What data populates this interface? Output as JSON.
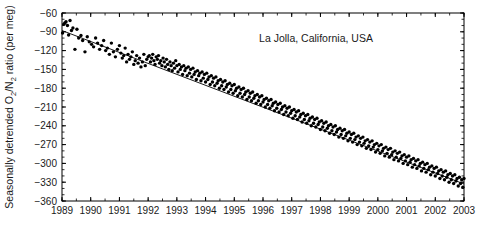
{
  "chart_data": {
    "type": "scatter",
    "title": "",
    "annotation": "La Jolla, California, USA",
    "xlabel": "",
    "ylabel": "Seasonally detrended O2/N2 ratio (per meg)",
    "ylabel_parts": {
      "pre": "Seasonally detrended O",
      "sub1": "2",
      "mid": "/N",
      "sub2": "2",
      "post": " ratio (per meg)"
    },
    "xlim": [
      1989,
      2003
    ],
    "ylim": [
      -360,
      -60
    ],
    "ytick_step": 30,
    "grid": false,
    "legend": "none",
    "minor_ticks": true,
    "marker": {
      "shape": "circle",
      "color": "#000000",
      "size_px": 2.4
    },
    "trendline": {
      "label": "linear fit",
      "color": "#000000",
      "width_px": 0.9,
      "x_start": 1989.0,
      "y_start": -88,
      "x_end": 2003.3,
      "y_end": -338,
      "slope_per_year": -17.5
    },
    "xticks": [
      "1989",
      "1990",
      "1991",
      "1992",
      "1993",
      "1994",
      "1995",
      "1996",
      "1997",
      "1998",
      "1999",
      "2000",
      "2001",
      "2002",
      "2003"
    ],
    "yticks": [
      "-60",
      "-90",
      "-120",
      "-150",
      "-180",
      "-210",
      "-240",
      "-270",
      "-300",
      "-330",
      "-360"
    ],
    "x": [
      1989.02,
      1989.06,
      1989.1,
      1989.14,
      1989.19,
      1989.23,
      1989.28,
      1989.33,
      1989.38,
      1989.45,
      1989.52,
      1989.58,
      1989.66,
      1989.72,
      1989.8,
      1989.88,
      1989.95,
      1990.03,
      1990.1,
      1990.17,
      1990.24,
      1990.31,
      1990.38,
      1990.45,
      1990.52,
      1990.58,
      1990.65,
      1990.72,
      1990.79,
      1990.86,
      1990.93,
      1991.0,
      1991.05,
      1991.1,
      1991.15,
      1991.2,
      1991.25,
      1991.3,
      1991.35,
      1991.4,
      1991.45,
      1991.5,
      1991.55,
      1991.6,
      1991.65,
      1991.7,
      1991.75,
      1991.8,
      1991.85,
      1991.9,
      1991.95,
      1992.0,
      1992.04,
      1992.08,
      1992.12,
      1992.16,
      1992.2,
      1992.24,
      1992.28,
      1992.32,
      1992.36,
      1992.4,
      1992.44,
      1992.48,
      1992.52,
      1992.56,
      1992.6,
      1992.64,
      1992.68,
      1992.72,
      1992.76,
      1992.8,
      1992.84,
      1992.88,
      1992.92,
      1992.96,
      1993.0,
      1993.04,
      1993.08,
      1993.12,
      1993.16,
      1993.2,
      1993.24,
      1993.28,
      1993.32,
      1993.36,
      1993.4,
      1993.44,
      1993.48,
      1993.52,
      1993.56,
      1993.6,
      1993.64,
      1993.68,
      1993.72,
      1993.76,
      1993.8,
      1993.84,
      1993.88,
      1993.92,
      1993.96,
      1994.0,
      1994.04,
      1994.08,
      1994.12,
      1994.16,
      1994.2,
      1994.24,
      1994.28,
      1994.32,
      1994.36,
      1994.4,
      1994.44,
      1994.48,
      1994.52,
      1994.56,
      1994.6,
      1994.64,
      1994.68,
      1994.72,
      1994.76,
      1994.8,
      1994.84,
      1994.88,
      1994.92,
      1994.96,
      1995.0,
      1995.04,
      1995.08,
      1995.12,
      1995.16,
      1995.2,
      1995.24,
      1995.28,
      1995.32,
      1995.36,
      1995.4,
      1995.44,
      1995.48,
      1995.52,
      1995.56,
      1995.6,
      1995.64,
      1995.68,
      1995.72,
      1995.76,
      1995.8,
      1995.84,
      1995.88,
      1995.92,
      1995.96,
      1996.0,
      1996.04,
      1996.08,
      1996.12,
      1996.16,
      1996.2,
      1996.24,
      1996.28,
      1996.32,
      1996.36,
      1996.4,
      1996.44,
      1996.48,
      1996.52,
      1996.56,
      1996.6,
      1996.64,
      1996.68,
      1996.72,
      1996.76,
      1996.8,
      1996.84,
      1996.88,
      1996.92,
      1996.96,
      1997.0,
      1997.04,
      1997.08,
      1997.12,
      1997.16,
      1997.2,
      1997.24,
      1997.28,
      1997.32,
      1997.36,
      1997.4,
      1997.44,
      1997.48,
      1997.52,
      1997.56,
      1997.6,
      1997.64,
      1997.68,
      1997.72,
      1997.76,
      1997.8,
      1997.84,
      1997.88,
      1997.92,
      1997.96,
      1998.0,
      1998.04,
      1998.08,
      1998.12,
      1998.16,
      1998.2,
      1998.24,
      1998.28,
      1998.32,
      1998.36,
      1998.4,
      1998.44,
      1998.48,
      1998.52,
      1998.56,
      1998.6,
      1998.64,
      1998.68,
      1998.72,
      1998.76,
      1998.8,
      1998.84,
      1998.88,
      1998.92,
      1998.96,
      1999.0,
      1999.04,
      1999.08,
      1999.12,
      1999.16,
      1999.2,
      1999.24,
      1999.28,
      1999.32,
      1999.36,
      1999.4,
      1999.44,
      1999.48,
      1999.52,
      1999.56,
      1999.6,
      1999.64,
      1999.68,
      1999.72,
      1999.76,
      1999.8,
      1999.84,
      1999.88,
      1999.92,
      1999.96,
      2000.0,
      2000.04,
      2000.08,
      2000.12,
      2000.16,
      2000.2,
      2000.24,
      2000.28,
      2000.32,
      2000.36,
      2000.4,
      2000.44,
      2000.48,
      2000.52,
      2000.56,
      2000.6,
      2000.64,
      2000.68,
      2000.72,
      2000.76,
      2000.8,
      2000.84,
      2000.88,
      2000.92,
      2000.96,
      2001.0,
      2001.04,
      2001.08,
      2001.12,
      2001.16,
      2001.2,
      2001.24,
      2001.28,
      2001.32,
      2001.36,
      2001.4,
      2001.44,
      2001.48,
      2001.52,
      2001.56,
      2001.6,
      2001.64,
      2001.68,
      2001.72,
      2001.76,
      2001.8,
      2001.84,
      2001.88,
      2001.92,
      2001.96,
      2002.0,
      2002.04,
      2002.08,
      2002.12,
      2002.16,
      2002.2,
      2002.24,
      2002.28,
      2002.32,
      2002.36,
      2002.4,
      2002.44,
      2002.48,
      2002.52,
      2002.56,
      2002.6,
      2002.64,
      2002.68,
      2002.72,
      2002.76,
      2002.8,
      2002.84,
      2002.88,
      2002.92,
      2002.96,
      2003.0,
      2003.04,
      2003.08,
      2003.12,
      2003.16,
      2003.2,
      2003.24,
      2003.28
    ],
    "y": [
      -92,
      -78,
      -76,
      -74,
      -80,
      -95,
      -72,
      -88,
      -84,
      -118,
      -86,
      -100,
      -96,
      -104,
      -122,
      -98,
      -106,
      -110,
      -114,
      -100,
      -108,
      -118,
      -112,
      -104,
      -120,
      -116,
      -126,
      -108,
      -122,
      -130,
      -118,
      -112,
      -124,
      -132,
      -128,
      -116,
      -138,
      -126,
      -134,
      -130,
      -122,
      -142,
      -136,
      -128,
      -140,
      -132,
      -146,
      -138,
      -126,
      -144,
      -134,
      -130,
      -128,
      -138,
      -132,
      -126,
      -136,
      -142,
      -130,
      -134,
      -128,
      -140,
      -136,
      -144,
      -132,
      -138,
      -146,
      -134,
      -142,
      -150,
      -138,
      -144,
      -152,
      -140,
      -148,
      -136,
      -144,
      -154,
      -142,
      -150,
      -146,
      -158,
      -144,
      -152,
      -148,
      -160,
      -146,
      -156,
      -150,
      -162,
      -148,
      -158,
      -154,
      -166,
      -152,
      -160,
      -156,
      -168,
      -154,
      -164,
      -158,
      -170,
      -156,
      -166,
      -162,
      -174,
      -160,
      -170,
      -164,
      -176,
      -162,
      -172,
      -168,
      -180,
      -166,
      -176,
      -170,
      -182,
      -168,
      -178,
      -174,
      -186,
      -172,
      -182,
      -176,
      -188,
      -174,
      -184,
      -180,
      -192,
      -178,
      -188,
      -182,
      -194,
      -180,
      -190,
      -186,
      -198,
      -184,
      -194,
      -188,
      -200,
      -186,
      -196,
      -192,
      -204,
      -190,
      -200,
      -194,
      -206,
      -192,
      -202,
      -198,
      -210,
      -196,
      -206,
      -200,
      -212,
      -198,
      -208,
      -204,
      -216,
      -202,
      -212,
      -206,
      -218,
      -204,
      -214,
      -210,
      -222,
      -208,
      -218,
      -212,
      -224,
      -210,
      -220,
      -216,
      -228,
      -214,
      -224,
      -218,
      -230,
      -216,
      -226,
      -222,
      -234,
      -220,
      -230,
      -224,
      -236,
      -222,
      -232,
      -228,
      -240,
      -226,
      -236,
      -230,
      -242,
      -228,
      -238,
      -234,
      -246,
      -232,
      -242,
      -236,
      -248,
      -234,
      -244,
      -240,
      -252,
      -238,
      -248,
      -242,
      -254,
      -240,
      -250,
      -246,
      -258,
      -244,
      -254,
      -248,
      -260,
      -246,
      -256,
      -252,
      -264,
      -250,
      -260,
      -254,
      -266,
      -252,
      -262,
      -258,
      -270,
      -256,
      -266,
      -260,
      -272,
      -258,
      -268,
      -264,
      -276,
      -262,
      -272,
      -266,
      -278,
      -264,
      -274,
      -270,
      -282,
      -268,
      -278,
      -272,
      -284,
      -270,
      -280,
      -276,
      -288,
      -274,
      -284,
      -278,
      -290,
      -276,
      -286,
      -282,
      -294,
      -280,
      -290,
      -284,
      -296,
      -282,
      -292,
      -288,
      -300,
      -286,
      -296,
      -290,
      -302,
      -288,
      -298,
      -294,
      -306,
      -292,
      -302,
      -296,
      -308,
      -294,
      -304,
      -300,
      -312,
      -298,
      -308,
      -302,
      -314,
      -300,
      -310,
      -306,
      -318,
      -304,
      -314,
      -308,
      -320,
      -306,
      -316,
      -312,
      -324,
      -310,
      -320,
      -314,
      -326,
      -312,
      -322,
      -318,
      -330,
      -316,
      -326,
      -320,
      -332,
      -318,
      -328,
      -324,
      -336,
      -322,
      -332,
      -326,
      -338,
      -324,
      -334,
      -330,
      -342,
      -328,
      -338,
      -332,
      -344,
      -330,
      -340,
      -336,
      -348,
      -334,
      -344,
      -338,
      -350,
      -336,
      -346
    ]
  }
}
